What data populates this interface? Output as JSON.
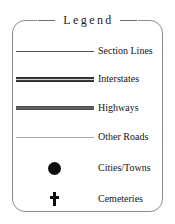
{
  "legend": {
    "title": "Legend",
    "frame_color": "#8b8b8b",
    "text_color": "#141414",
    "entries": [
      {
        "label": "Section Lines",
        "symbol": "thin-dark-line",
        "color": "#555555"
      },
      {
        "label": "Interstates",
        "symbol": "thick-cased-line",
        "color": "#3c3c3c"
      },
      {
        "label": "Highways",
        "symbol": "thick-solid-line",
        "color": "#636363"
      },
      {
        "label": "Other Roads",
        "symbol": "thin-light-line",
        "color": "#a9a9a9"
      },
      {
        "label": "Cities/Towns",
        "symbol": "filled-circle-icon",
        "color": "#0d0d0d"
      },
      {
        "label": "Cemeteries",
        "symbol": "cross-icon",
        "color": "#0d0d0d"
      }
    ]
  }
}
